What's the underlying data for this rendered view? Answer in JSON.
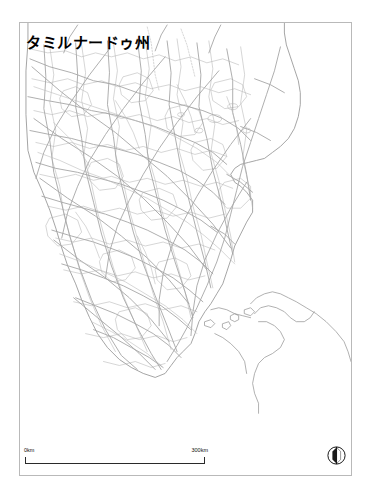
{
  "map": {
    "title": "タミルナードゥ州",
    "region": "Tamil Nadu",
    "style": "outline-map",
    "frame": {
      "border_color": "#b9b9b9",
      "background_color": "#ffffff"
    },
    "layers": {
      "coastline_color": "#8c8c8c",
      "district_border_color": "#b0b0b0",
      "road_color": "#a8a8a8",
      "river_color": "#b4b4b4",
      "land_fill": "#ffffff",
      "ocean_fill": "#ffffff"
    },
    "scale": {
      "start_label": "0km",
      "end_label": "300km",
      "bar_length_px": 180,
      "represents_km": 300
    },
    "compass": {
      "icon": "north-arrow-icon",
      "needle_direction": "north",
      "dark_half_color": "#1a1a1a",
      "light_half_color": "#ffffff",
      "ring_color": "#1a1a1a"
    }
  }
}
